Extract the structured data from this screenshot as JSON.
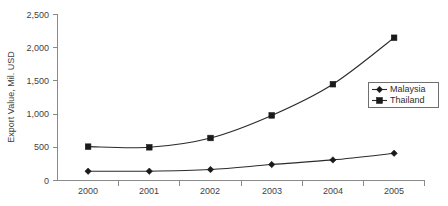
{
  "chart_data": {
    "type": "line",
    "title": "",
    "xlabel": "",
    "ylabel": "Export Value,  Mil. USD",
    "categories": [
      "2000",
      "2001",
      "2002",
      "2003",
      "2004",
      "2005"
    ],
    "series": [
      {
        "name": "Malaysia",
        "marker": "diamond",
        "values": [
          140,
          140,
          165,
          240,
          310,
          410
        ]
      },
      {
        "name": "Thailand",
        "marker": "square",
        "values": [
          510,
          500,
          640,
          980,
          1450,
          2150
        ]
      }
    ],
    "ylim": [
      0,
      2500
    ],
    "yticks": [
      0,
      500,
      1000,
      1500,
      2000,
      2500
    ],
    "ytick_labels": [
      "0",
      "500",
      "1,000",
      "1,500",
      "2,000",
      "2,500"
    ],
    "grid": false,
    "legend_position": "center-right",
    "line_color": "#2b2b2b",
    "axis_color": "#8a8a8a",
    "background": "#ffffff"
  },
  "legend": {
    "entries": [
      {
        "label": "Malaysia",
        "marker": "diamond-marker"
      },
      {
        "label": "Thailand",
        "marker": "square-marker"
      }
    ]
  },
  "footer": {
    "clipped_caption": ""
  }
}
